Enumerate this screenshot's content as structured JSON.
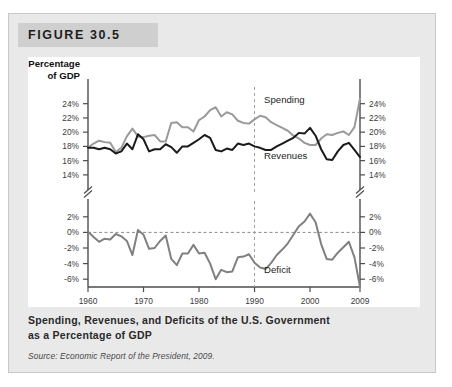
{
  "figure": {
    "header_label": "FIGURE 30.5",
    "caption_line1": "Spending, Revenues, and Deficits of the U.S. Government",
    "caption_line2": "as a Percentage of GDP",
    "source": "Source: Economic Report of the President, 2009."
  },
  "colors": {
    "panel_background": "#e9e9e9",
    "header_background": "#cfcfcf",
    "plot_background": "#ffffff",
    "spending_line": "#9a9a9a",
    "revenues_line": "#1a1a1a",
    "deficit_line": "#808080",
    "axis": "#4d4d4d",
    "zero_line": "#8c8c8c",
    "marker_1990": "#a0a0a0"
  },
  "chart_data": {
    "type": "line",
    "title": "Spending, Revenues, and Deficits of the U.S. Government as a Percentage of GDP",
    "xlabel": "Year",
    "ylabel": "Percentage of GDP",
    "grid": false,
    "legend_position": "inline-annotation",
    "x_ticks": [
      "1960",
      "1970",
      "1980",
      "1990",
      "2000",
      "2009"
    ],
    "x_tick_values": [
      1960,
      1970,
      1980,
      1990,
      2000,
      2009
    ],
    "xlim": [
      1960,
      2009
    ],
    "upper_panel": {
      "y_ticks": [
        "24%",
        "22%",
        "20%",
        "18%",
        "16%",
        "14%"
      ],
      "y_tick_values": [
        24,
        22,
        20,
        18,
        16,
        14
      ],
      "ylim": [
        13,
        25.5
      ]
    },
    "lower_panel": {
      "y_ticks": [
        "2%",
        "0%",
        "-2%",
        "-4%",
        "-6%"
      ],
      "y_tick_values": [
        2,
        0,
        -2,
        -4,
        -6
      ],
      "ylim": [
        -7,
        3
      ]
    },
    "axis_break": true,
    "annotations": [
      {
        "text": "Spending",
        "x": 1991,
        "y": 24.1
      },
      {
        "text": "Revenues",
        "x": 1991,
        "y": 16.3
      },
      {
        "text": "Deficit",
        "x": 1991,
        "y": -5.2
      },
      {
        "text": "Year",
        "x": 2009,
        "y": null
      }
    ],
    "reference_lines": [
      {
        "type": "vertical",
        "value": 1990,
        "style": "dashed"
      },
      {
        "type": "horizontal",
        "value": 0,
        "style": "dashed",
        "panel": "lower"
      }
    ],
    "x": [
      1960,
      1961,
      1962,
      1963,
      1964,
      1965,
      1966,
      1967,
      1968,
      1969,
      1970,
      1971,
      1972,
      1973,
      1974,
      1975,
      1976,
      1977,
      1978,
      1979,
      1980,
      1981,
      1982,
      1983,
      1984,
      1985,
      1986,
      1987,
      1988,
      1989,
      1990,
      1991,
      1992,
      1993,
      1994,
      1995,
      1996,
      1997,
      1998,
      1999,
      2000,
      2001,
      2002,
      2003,
      2004,
      2005,
      2006,
      2007,
      2008,
      2009
    ],
    "series": [
      {
        "name": "Spending",
        "color": "#9a9a9a",
        "panel": "upper",
        "values": [
          17.8,
          18.4,
          18.8,
          18.6,
          18.5,
          17.2,
          17.8,
          19.4,
          20.5,
          19.4,
          19.3,
          19.5,
          19.6,
          18.7,
          18.7,
          21.3,
          21.4,
          20.7,
          20.7,
          20.1,
          21.7,
          22.2,
          23.1,
          23.5,
          22.2,
          22.8,
          22.5,
          21.6,
          21.3,
          21.2,
          21.8,
          22.3,
          22.1,
          21.4,
          21.0,
          20.6,
          20.2,
          19.5,
          19.1,
          18.5,
          18.2,
          18.2,
          19.1,
          19.7,
          19.6,
          19.9,
          20.1,
          19.6,
          20.7,
          24.7
        ]
      },
      {
        "name": "Revenues",
        "color": "#1a1a1a",
        "panel": "upper",
        "values": [
          17.8,
          17.8,
          17.6,
          17.8,
          17.6,
          17.0,
          17.3,
          18.4,
          17.6,
          19.7,
          19.0,
          17.3,
          17.6,
          17.6,
          18.3,
          17.9,
          17.1,
          18.0,
          18.0,
          18.5,
          19.0,
          19.6,
          19.2,
          17.5,
          17.3,
          17.7,
          17.5,
          18.4,
          18.2,
          18.4,
          18.0,
          17.8,
          17.5,
          17.5,
          18.0,
          18.4,
          18.8,
          19.2,
          19.9,
          19.8,
          20.6,
          19.5,
          17.6,
          16.2,
          16.1,
          17.3,
          18.2,
          18.5,
          17.5,
          16.5
        ]
      },
      {
        "name": "Deficit",
        "color": "#808080",
        "panel": "lower",
        "values": [
          0.1,
          -0.6,
          -1.2,
          -0.8,
          -0.9,
          -0.2,
          -0.5,
          -1.1,
          -2.9,
          0.3,
          -0.3,
          -2.1,
          -2.0,
          -1.1,
          -0.4,
          -3.4,
          -4.2,
          -2.7,
          -2.7,
          -1.6,
          -2.7,
          -2.6,
          -4.0,
          -6.0,
          -4.8,
          -5.1,
          -5.0,
          -3.2,
          -3.1,
          -2.8,
          -3.9,
          -4.5,
          -4.7,
          -3.9,
          -2.9,
          -2.2,
          -1.4,
          -0.3,
          0.8,
          1.4,
          2.4,
          1.3,
          -1.5,
          -3.4,
          -3.5,
          -2.6,
          -1.9,
          -1.2,
          -3.2,
          -8.2
        ]
      }
    ]
  }
}
